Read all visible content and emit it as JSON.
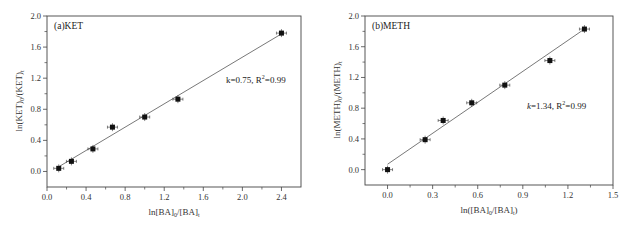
{
  "chart_data": [
    {
      "type": "scatter",
      "panel_label": "(a)KET",
      "title": "",
      "xlabel": "ln[BA]0/[BA]t",
      "ylabel": "ln(KET)0/(KET)t",
      "xlim": [
        0.0,
        2.6
      ],
      "ylim": [
        -0.2,
        2.0
      ],
      "xticks": [
        "0.0",
        "0.4",
        "0.8",
        "1.2",
        "1.6",
        "2.0",
        "2.4"
      ],
      "yticks": [
        "0.0",
        "0.4",
        "0.8",
        "1.2",
        "1.6",
        "2.0"
      ],
      "grid": false,
      "series": [
        {
          "name": "KET",
          "marker": "square",
          "x": [
            0.12,
            0.25,
            0.47,
            0.67,
            1.0,
            1.34,
            2.4
          ],
          "y": [
            0.04,
            0.13,
            0.29,
            0.57,
            0.7,
            0.93,
            1.78
          ],
          "error_bars": true
        }
      ],
      "fit_line": {
        "x": [
          0.12,
          2.4
        ],
        "y": [
          0.06,
          1.77
        ]
      },
      "annotation": "k=0.75, R²=0.99",
      "slope": 0.75,
      "r_squared": 0.99
    },
    {
      "type": "scatter",
      "panel_label": "(b)METH",
      "title": "",
      "xlabel": "ln([BA]0/[BA]t)",
      "ylabel": "ln(METH)0/(METH)t",
      "xlim": [
        -0.15,
        1.5
      ],
      "ylim": [
        -0.2,
        2.0
      ],
      "xticks": [
        "0.0",
        "0.3",
        "0.6",
        "0.9",
        "1.2",
        "1.5"
      ],
      "yticks": [
        "0.0",
        "0.4",
        "0.8",
        "1.2",
        "1.6",
        "2.0"
      ],
      "grid": false,
      "series": [
        {
          "name": "METH",
          "marker": "square",
          "x": [
            0.0,
            0.25,
            0.37,
            0.56,
            0.78,
            1.08,
            1.31
          ],
          "y": [
            0.0,
            0.39,
            0.64,
            0.87,
            1.1,
            1.42,
            1.83
          ],
          "error_bars": true
        }
      ],
      "fit_line": {
        "x": [
          0.0,
          1.31
        ],
        "y": [
          0.07,
          1.83
        ]
      },
      "annotation": "k=1.34, R²=0.99",
      "slope": 1.34,
      "r_squared": 0.99
    }
  ],
  "labels": {
    "a_panel": "(a)KET",
    "a_annot_k": "k=0.75, R",
    "a_annot_sup": "2",
    "a_annot_rest": "=0.99",
    "a_xlabel_main": "ln[BA]",
    "a_xlabel_sub0": "0",
    "a_xlabel_mid": "/[BA]",
    "a_xlabel_subt": "t",
    "a_ylabel_main": "ln(KET)",
    "a_ylabel_sub0": "0",
    "a_ylabel_mid": "/(KET)",
    "a_ylabel_subt": "t",
    "b_panel": "(b)METH",
    "b_annot_k": "k",
    "b_annot_rest1": "=1.34, R",
    "b_annot_sup": "2",
    "b_annot_rest2": "=0.99",
    "b_xlabel_main": "ln([BA]",
    "b_xlabel_sub0": "0",
    "b_xlabel_mid": "/[BA]",
    "b_xlabel_subt": "t",
    "b_xlabel_end": ")",
    "b_ylabel_main": "ln(METH)",
    "b_ylabel_sub0": "0",
    "b_ylabel_mid": "/(METH)",
    "b_ylabel_subt": "t"
  }
}
